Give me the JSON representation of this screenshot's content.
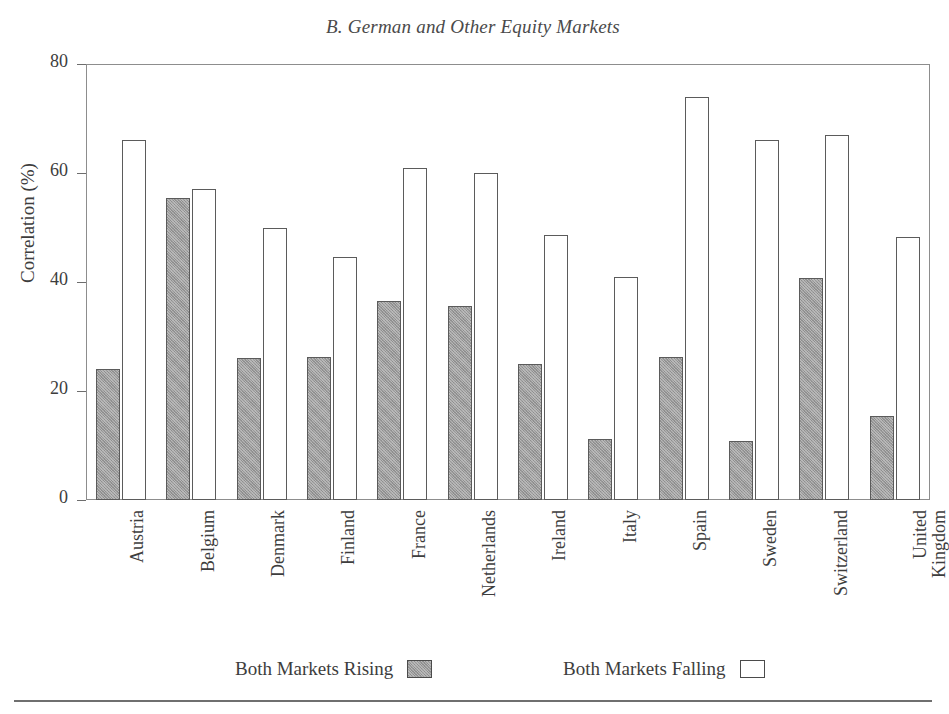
{
  "chart_data": {
    "type": "bar",
    "title": "B. German and Other Equity Markets",
    "xlabel": "",
    "ylabel": "Correlation (%)",
    "ylim": [
      0,
      80
    ],
    "yticks": [
      0,
      20,
      40,
      60,
      80
    ],
    "grid": false,
    "legend_position": "bottom",
    "categories": [
      "Austria",
      "Belgium",
      "Denmark",
      "Finland",
      "France",
      "Netherlands",
      "Ireland",
      "Italy",
      "Spain",
      "Sweden",
      "Switzerland",
      "United Kingdom"
    ],
    "category_lines": [
      [
        "Austria"
      ],
      [
        "Belgium"
      ],
      [
        "Denmark"
      ],
      [
        "Finland"
      ],
      [
        "France"
      ],
      [
        "Netherlands"
      ],
      [
        "Ireland"
      ],
      [
        "Italy"
      ],
      [
        "Spain"
      ],
      [
        "Sweden"
      ],
      [
        "Switzerland"
      ],
      [
        "United",
        "Kingdom"
      ]
    ],
    "series": [
      {
        "name": "Both Markets Rising",
        "style": "filled-grey",
        "color": "#9a9a9a",
        "values": [
          24.0,
          55.5,
          26.0,
          26.3,
          36.6,
          35.6,
          25.0,
          11.2,
          26.2,
          10.8,
          40.7,
          15.5
        ]
      },
      {
        "name": "Both Markets Falling",
        "style": "hollow-white",
        "color": "#ffffff",
        "values": [
          66.0,
          57.0,
          50.0,
          44.6,
          61.0,
          60.0,
          48.6,
          41.0,
          74.0,
          66.0,
          67.0,
          48.2
        ]
      }
    ]
  },
  "title": {
    "text": "B. German and Other Equity Markets"
  },
  "axes": {
    "y_title": "Correlation (%)",
    "y_ticks": [
      "80",
      "60",
      "40",
      "20",
      "0"
    ]
  },
  "legend": {
    "rising_label": "Both Markets Rising",
    "falling_label": "Both Markets Falling"
  },
  "colors": {
    "bar_rising_fill": "#9a9a9a",
    "bar_falling_fill": "#ffffff",
    "bar_outline": "#5b5b5b",
    "frame": "#8d8d8d",
    "text": "#3d3d3d"
  }
}
